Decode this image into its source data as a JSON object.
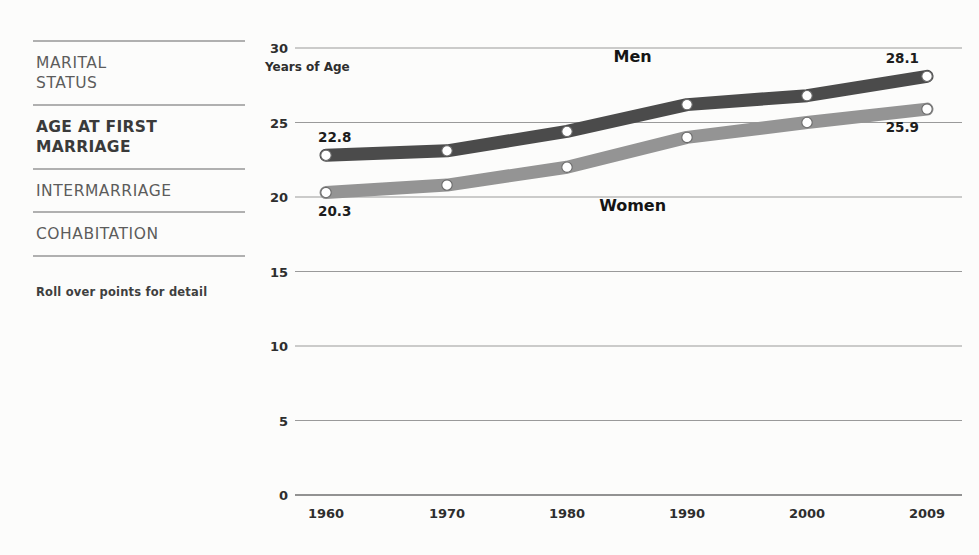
{
  "sidebar": {
    "items": [
      {
        "label": "MARITAL\nSTATUS",
        "active": false
      },
      {
        "label": "AGE AT FIRST\nMARRIAGE",
        "active": true
      },
      {
        "label": "INTERMARRIAGE",
        "active": false
      },
      {
        "label": "COHABITATION",
        "active": false
      }
    ],
    "hint": "Roll over points for detail"
  },
  "colors": {
    "men_line": "#4b4b4b",
    "women_line": "#949494",
    "grid": "#9a9a9a",
    "axis": "#6f6f6f",
    "marker_fill": "#ffffff",
    "text": "#2e2e2e",
    "sidebar_text": "#5c5c5c",
    "sidebar_rule": "#b0b0b0",
    "background": "#fcfcfb"
  },
  "chart_data": {
    "type": "line",
    "title": "",
    "xlabel": "",
    "ylabel": "Years of Age",
    "ylim": [
      0,
      30
    ],
    "yticks": [
      0,
      5,
      10,
      15,
      20,
      25,
      30
    ],
    "ytick_labels": [
      "0",
      "5",
      "10",
      "15",
      "20",
      "25",
      "30"
    ],
    "x": [
      1960,
      1970,
      1980,
      1990,
      2000,
      2009
    ],
    "xtick_labels": [
      "1960",
      "1970",
      "1980",
      "1990",
      "2000",
      "2009"
    ],
    "grid": true,
    "legend": "inline-labels",
    "series": [
      {
        "name": "Men",
        "color": "#4b4b4b",
        "values": [
          22.8,
          23.1,
          24.4,
          26.2,
          26.8,
          28.1
        ],
        "label_position": {
          "x": 1985,
          "y": 29.4
        },
        "endpoint_labels": [
          {
            "index": 0,
            "text": "22.8"
          },
          {
            "index": 5,
            "text": "28.1"
          }
        ]
      },
      {
        "name": "Women",
        "color": "#949494",
        "values": [
          20.3,
          20.8,
          22.0,
          24.0,
          25.0,
          25.9
        ],
        "label_position": {
          "x": 1985,
          "y": 19.4
        },
        "endpoint_labels": [
          {
            "index": 0,
            "text": "20.3"
          },
          {
            "index": 5,
            "text": "25.9"
          }
        ]
      }
    ]
  }
}
